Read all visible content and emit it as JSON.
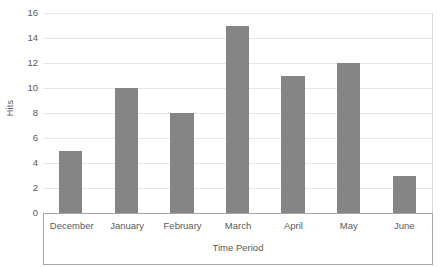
{
  "chart_data": {
    "type": "bar",
    "title": "",
    "subtitle": "",
    "xlabel": "Time Period",
    "ylabel": "Hits",
    "categories": [
      "December",
      "January",
      "February",
      "March",
      "April",
      "May",
      "June"
    ],
    "values": [
      5,
      10,
      8,
      15,
      11,
      12,
      3
    ],
    "series": [
      {
        "name": "Hits",
        "values": [
          5,
          10,
          8,
          15,
          11,
          12,
          3
        ]
      }
    ],
    "ylim": [
      0,
      16
    ],
    "xlim": null,
    "y_ticks": [
      0,
      2,
      4,
      6,
      8,
      10,
      12,
      14,
      16
    ],
    "y_tick_labels": [
      "0",
      "2",
      "4",
      "6",
      "8",
      "10",
      "12",
      "14",
      "16"
    ],
    "y_tick_step": 2,
    "grid": true,
    "grid_axis": "y",
    "legend": false,
    "legend_position": "none",
    "annotations": [],
    "data_labels": false,
    "bar_color": "#858585",
    "gridline_color": "#e6e6e6",
    "axis_line_color": "#a6a6a6",
    "text_color": "#595959",
    "background_color": "#ffffff",
    "orientation": "vertical"
  }
}
